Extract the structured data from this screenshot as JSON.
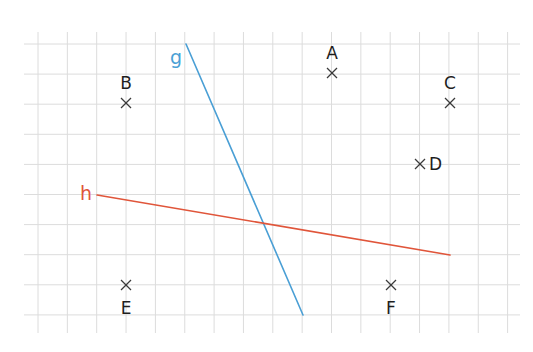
{
  "diagram": {
    "type": "grid-geometry",
    "grid": {
      "x0": 38,
      "dx": 29.35,
      "cols": 17,
      "y0": 44,
      "dy": 30.1,
      "rows": 10,
      "h_extent": [
        24,
        520
      ],
      "v_extent": [
        32,
        333
      ],
      "color": "#dcdcdc"
    },
    "lines": [
      {
        "id": "g",
        "label": "g",
        "color": "#4a9fd5",
        "from": [
          186,
          44
        ],
        "to": [
          303,
          315
        ],
        "label_pos": [
          176,
          64
        ]
      },
      {
        "id": "h",
        "label": "h",
        "color": "#e0553a",
        "from": [
          97,
          195
        ],
        "to": [
          450,
          255
        ],
        "label_pos": [
          86,
          200
        ]
      }
    ],
    "points": [
      {
        "id": "A",
        "label": "A",
        "pos": [
          332,
          73
        ],
        "label_pos": [
          332,
          59
        ],
        "anchor": "middle"
      },
      {
        "id": "B",
        "label": "B",
        "pos": [
          126,
          103
        ],
        "label_pos": [
          126,
          89
        ],
        "anchor": "middle"
      },
      {
        "id": "C",
        "label": "C",
        "pos": [
          450,
          103
        ],
        "label_pos": [
          450,
          89
        ],
        "anchor": "middle"
      },
      {
        "id": "D",
        "label": "D",
        "pos": [
          420,
          164
        ],
        "label_pos": [
          429,
          170
        ],
        "anchor": "start"
      },
      {
        "id": "E",
        "label": "E",
        "pos": [
          126,
          285
        ],
        "label_pos": [
          126,
          314
        ],
        "anchor": "middle"
      },
      {
        "id": "F",
        "label": "F",
        "pos": [
          391,
          285
        ],
        "label_pos": [
          391,
          314
        ],
        "anchor": "middle"
      }
    ],
    "cross_size": 5
  }
}
